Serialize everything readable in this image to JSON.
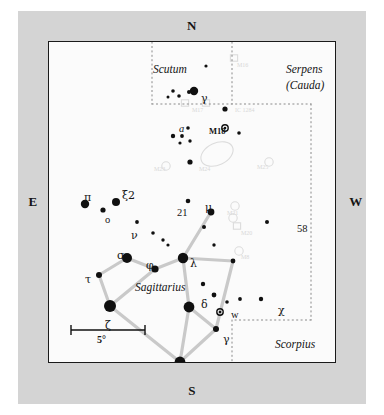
{
  "figure": {
    "type": "star-chart",
    "title": "",
    "region": "Sagittarius"
  },
  "cardinals": {
    "north": "N",
    "south": "S",
    "east": "E",
    "west": "W"
  },
  "scale_bar": {
    "label": "5°",
    "degrees": 5
  },
  "constellations": [
    {
      "name": "Scutum",
      "x": 104,
      "y": 22,
      "style": "italic"
    },
    {
      "name": "Serpens",
      "x": 237,
      "y": 22,
      "style": "italic"
    },
    {
      "name": "(Cauda)",
      "x": 237,
      "y": 38,
      "style": "italic"
    },
    {
      "name": "Sagittarius",
      "x": 86,
      "y": 240,
      "style": "italic"
    },
    {
      "name": "Scorpius",
      "x": 226,
      "y": 297,
      "style": "italic"
    }
  ],
  "star_labels": [
    {
      "text": "γ",
      "x": 152,
      "y": 51,
      "kind": "greek"
    },
    {
      "text": "a",
      "x": 130,
      "y": 82,
      "kind": "italic"
    },
    {
      "text": "M18",
      "x": 160,
      "y": 85,
      "kind": "messier"
    },
    {
      "text": "π",
      "x": 35,
      "y": 150,
      "kind": "greek"
    },
    {
      "text": "ξ2",
      "x": 73,
      "y": 148,
      "kind": "greek"
    },
    {
      "text": "o",
      "x": 56,
      "y": 173,
      "kind": "plain"
    },
    {
      "text": "ν",
      "x": 82,
      "y": 188,
      "kind": "greek"
    },
    {
      "text": "21",
      "x": 128,
      "y": 166,
      "kind": "plain"
    },
    {
      "text": "μ",
      "x": 156,
      "y": 160,
      "kind": "greek"
    },
    {
      "text": "58",
      "x": 248,
      "y": 182,
      "kind": "plain"
    },
    {
      "text": "σ",
      "x": 68,
      "y": 208,
      "kind": "greek"
    },
    {
      "text": "φ",
      "x": 97,
      "y": 218,
      "kind": "greek"
    },
    {
      "text": "λ",
      "x": 141,
      "y": 216,
      "kind": "greek"
    },
    {
      "text": "τ",
      "x": 36,
      "y": 232,
      "kind": "greek"
    },
    {
      "text": "ζ",
      "x": 56,
      "y": 278,
      "kind": "greek"
    },
    {
      "text": "δ",
      "x": 152,
      "y": 257,
      "kind": "greek"
    },
    {
      "text": "w",
      "x": 182,
      "y": 268,
      "kind": "plain"
    },
    {
      "text": "χ",
      "x": 229,
      "y": 263,
      "kind": "greek"
    },
    {
      "text": "γ",
      "x": 174,
      "y": 292,
      "kind": "greek"
    },
    {
      "text": "ε",
      "x": 135,
      "y": 321,
      "kind": "greek"
    },
    {
      "text": "η",
      "x": 145,
      "y": 345,
      "kind": "greek"
    }
  ],
  "deep_sky_labels": [
    {
      "text": "M16",
      "x": 188,
      "y": 20
    },
    {
      "text": "M17",
      "x": 143,
      "y": 65
    },
    {
      "text": "IC 1284",
      "x": 186,
      "y": 65
    },
    {
      "text": "M23",
      "x": 105,
      "y": 124
    },
    {
      "text": "M24",
      "x": 150,
      "y": 124
    },
    {
      "text": "M25",
      "x": 208,
      "y": 122
    },
    {
      "text": "M21",
      "x": 178,
      "y": 168
    },
    {
      "text": "M20",
      "x": 192,
      "y": 188
    },
    {
      "text": "M8",
      "x": 192,
      "y": 212
    }
  ],
  "stars": [
    {
      "x": 157,
      "y": 24,
      "r": 1.6
    },
    {
      "x": 124,
      "y": 49,
      "r": 1.8
    },
    {
      "x": 119,
      "y": 55,
      "r": 1.5
    },
    {
      "x": 130,
      "y": 54,
      "r": 1.8
    },
    {
      "x": 140,
      "y": 50,
      "r": 2.0
    },
    {
      "x": 145,
      "y": 49,
      "r": 4.2
    },
    {
      "x": 176,
      "y": 67,
      "r": 2.6
    },
    {
      "x": 139,
      "y": 86,
      "r": 1.8
    },
    {
      "x": 190,
      "y": 91,
      "r": 1.8
    },
    {
      "x": 124,
      "y": 94,
      "r": 2.2
    },
    {
      "x": 133,
      "y": 94,
      "r": 1.9
    },
    {
      "x": 131,
      "y": 101,
      "r": 1.6
    },
    {
      "x": 141,
      "y": 99,
      "r": 1.7
    },
    {
      "x": 141,
      "y": 120,
      "r": 2.6
    },
    {
      "x": 139,
      "y": 159,
      "r": 2.3
    },
    {
      "x": 162,
      "y": 170,
      "r": 3.4
    },
    {
      "x": 36,
      "y": 162,
      "r": 4.2
    },
    {
      "x": 67,
      "y": 160,
      "r": 4.0
    },
    {
      "x": 54,
      "y": 168,
      "r": 2.6
    },
    {
      "x": 88,
      "y": 180,
      "r": 1.9
    },
    {
      "x": 218,
      "y": 180,
      "r": 2.0
    },
    {
      "x": 155,
      "y": 185,
      "r": 2.0
    },
    {
      "x": 104,
      "y": 191,
      "r": 1.8
    },
    {
      "x": 114,
      "y": 198,
      "r": 1.7
    },
    {
      "x": 119,
      "y": 203,
      "r": 1.6
    },
    {
      "x": 165,
      "y": 203,
      "r": 1.7
    },
    {
      "x": 134,
      "y": 216,
      "r": 5.2
    },
    {
      "x": 78,
      "y": 216,
      "r": 5.0
    },
    {
      "x": 106,
      "y": 227,
      "r": 3.6
    },
    {
      "x": 184,
      "y": 219,
      "r": 2.4
    },
    {
      "x": 50,
      "y": 233,
      "r": 3.0
    },
    {
      "x": 154,
      "y": 242,
      "r": 2.2
    },
    {
      "x": 61,
      "y": 264,
      "r": 6.0
    },
    {
      "x": 140,
      "y": 265,
      "r": 5.4
    },
    {
      "x": 165,
      "y": 253,
      "r": 2.4
    },
    {
      "x": 178,
      "y": 260,
      "r": 1.8
    },
    {
      "x": 191,
      "y": 257,
      "r": 1.9
    },
    {
      "x": 212,
      "y": 257,
      "r": 2.2
    },
    {
      "x": 167,
      "y": 287,
      "r": 3.0
    },
    {
      "x": 131,
      "y": 320,
      "r": 5.4
    },
    {
      "x": 137,
      "y": 345,
      "r": 3.2
    }
  ],
  "double_circle_stars": [
    {
      "x": 176,
      "y": 86,
      "r": 3.2,
      "name": "M18-marker"
    },
    {
      "x": 171,
      "y": 270,
      "r": 3.2,
      "name": "w-marker"
    }
  ],
  "constellation_lines": [
    {
      "from": [
        162,
        170
      ],
      "to": [
        134,
        216
      ]
    },
    {
      "from": [
        134,
        216
      ],
      "to": [
        106,
        227
      ]
    },
    {
      "from": [
        106,
        227
      ],
      "to": [
        78,
        216
      ]
    },
    {
      "from": [
        78,
        216
      ],
      "to": [
        50,
        233
      ]
    },
    {
      "from": [
        50,
        233
      ],
      "to": [
        61,
        264
      ]
    },
    {
      "from": [
        61,
        264
      ],
      "to": [
        106,
        227
      ]
    },
    {
      "from": [
        61,
        264
      ],
      "to": [
        131,
        320
      ]
    },
    {
      "from": [
        131,
        320
      ],
      "to": [
        140,
        265
      ]
    },
    {
      "from": [
        140,
        265
      ],
      "to": [
        134,
        216
      ]
    },
    {
      "from": [
        140,
        265
      ],
      "to": [
        167,
        287
      ]
    },
    {
      "from": [
        167,
        287
      ],
      "to": [
        131,
        320
      ]
    },
    {
      "from": [
        167,
        287
      ],
      "to": [
        184,
        219
      ]
    },
    {
      "from": [
        184,
        219
      ],
      "to": [
        134,
        216
      ]
    }
  ],
  "dotted_boundaries": [
    {
      "points": "103,0 103,62"
    },
    {
      "points": "103,62 262,62"
    },
    {
      "points": "183,0 183,62"
    },
    {
      "points": "262,62 262,278"
    },
    {
      "points": "262,278 183,278"
    },
    {
      "points": "183,278 183,322"
    }
  ],
  "nebula_outlines": [
    {
      "name": "M24-star-cloud",
      "cx": 168,
      "cy": 112,
      "rx": 17,
      "ry": 11,
      "rot": -25
    }
  ]
}
